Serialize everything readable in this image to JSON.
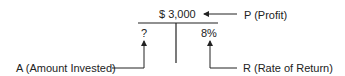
{
  "diagram": {
    "profit_value": "$ 3,000",
    "amount_value": "?",
    "rate_value": "8%",
    "labels": {
      "profit": "P (Profit)",
      "amount": "A (Amount Invested)",
      "rate": "R (Rate of Return)"
    }
  }
}
